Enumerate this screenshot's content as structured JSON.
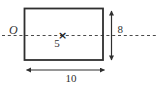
{
  "diagram": {
    "shape": "rectangle",
    "origin_label": "O",
    "center_marker": "×",
    "center_distance_label": "5",
    "height_label": "8",
    "width_label": "10",
    "colors": {
      "line": "#2f2f2f",
      "dashed_axis": "#4a4a4a",
      "background": "#ffffff"
    }
  }
}
